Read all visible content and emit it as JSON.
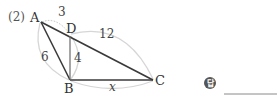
{
  "problem_label": "(2)",
  "points": {
    "A": "A",
    "B": "B",
    "C": "C",
    "D": "D"
  },
  "lengths": {
    "AD": "3",
    "DC": "12",
    "AB": "6",
    "BD": "4",
    "BC": "x"
  },
  "answer": {
    "badge_label": "답",
    "value": ""
  },
  "colors": {
    "edge": "#3a3a3a",
    "arc": "#d6d6d6",
    "badge": "#555555"
  }
}
